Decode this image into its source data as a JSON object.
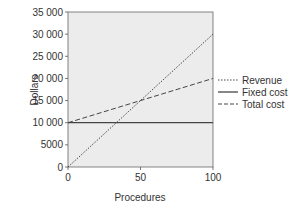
{
  "chart_data": {
    "type": "line",
    "title": "",
    "xlabel": "Procedures",
    "ylabel": "Dollars",
    "xlim": [
      0,
      100
    ],
    "ylim": [
      0,
      35000
    ],
    "xticks": [
      0,
      50,
      100
    ],
    "xtick_labels": [
      "0",
      "50",
      "100"
    ],
    "yticks": [
      0,
      5000,
      10000,
      15000,
      20000,
      25000,
      30000,
      35000
    ],
    "ytick_labels": [
      "0",
      "5000",
      "10 000",
      "15 000",
      "20 000",
      "25 000",
      "30 000",
      "35 000"
    ],
    "grid": false,
    "legend_position": "right",
    "x": [
      0,
      100
    ],
    "series": [
      {
        "name": "Revenue",
        "style": "dotted",
        "values": [
          0,
          30000
        ]
      },
      {
        "name": "Fixed cost",
        "style": "solid",
        "values": [
          10000,
          10000
        ]
      },
      {
        "name": "Total cost",
        "style": "dashed",
        "values": [
          10000,
          20000
        ]
      }
    ],
    "colors": {
      "plot_background": "#ececec",
      "line": "#444444",
      "text": "#333333"
    }
  }
}
